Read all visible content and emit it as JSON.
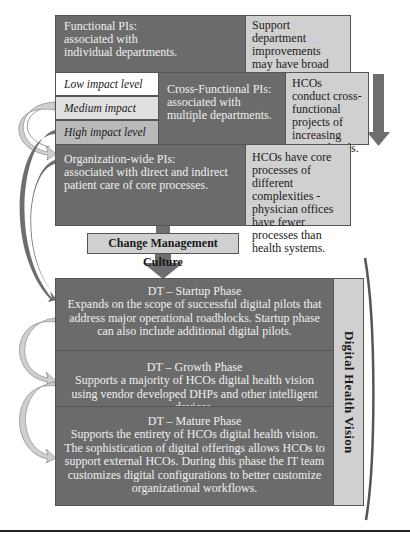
{
  "pi_levels": {
    "functional": {
      "title": "Functional PIs:",
      "desc_1": "associated with",
      "desc_2": "individual departments.",
      "note": "Support department improvements may have broad impact throughout HCOs."
    },
    "impact_levels": [
      "Low impact level",
      "Medium impact level",
      "High impact level"
    ],
    "cross_functional": {
      "title": "Cross-Functional PIs:",
      "desc_1": "associated with",
      "desc_2": "multiple departments.",
      "note": "HCOs conduct cross-functional projects of increasing impact levels."
    },
    "organization_wide": {
      "title": "Organization-wide PIs:",
      "desc_1": "associated with direct and indirect",
      "desc_2": "patient care of core processes.",
      "note": "HCOs have core processes of different complexities - physician offices have fewer processes than health systems."
    }
  },
  "culture": {
    "label": "Change Management Culture"
  },
  "phases": [
    {
      "title": "DT – Startup Phase",
      "desc": "Expands on the scope of successful digital pilots that address major operational roadblocks.  Startup phase can also include additional digital pilots."
    },
    {
      "title": "DT – Growth Phase",
      "desc": "Supports a majority of HCOs digital health vision using vendor developed DHPs and other intelligent devices."
    },
    {
      "title": "DT – Mature Phase",
      "desc": "Supports the entirety of HCOs digital health vision. The sophistication of digital offerings allows HCOs to support external HCOs.  During this phase the IT team customizes digital configurations to better customize organizational workflows."
    }
  ],
  "vision": {
    "label": "Digital Health Vision"
  },
  "colors": {
    "dark_box": "#6b6b6b",
    "light_box": "#d0d0d0",
    "arrow_dark": "#666666",
    "arrow_light": "#c8c8c8"
  }
}
